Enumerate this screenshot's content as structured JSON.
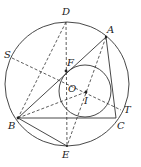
{
  "diagram": {
    "type": "geometry",
    "stroke_color": "#333333",
    "background": "#ffffff",
    "circumcircle": {
      "cx": 67,
      "cy": 84,
      "r": 62
    },
    "incircle": {
      "cx": 85,
      "cy": 91,
      "r": 26
    },
    "points": {
      "A": {
        "label": "A",
        "x": 106,
        "y": 37
      },
      "B": {
        "label": "B",
        "x": 18,
        "y": 118
      },
      "C": {
        "label": "C",
        "x": 116,
        "y": 118
      },
      "D": {
        "label": "D",
        "x": 66,
        "y": 22
      },
      "E": {
        "label": "E",
        "x": 67,
        "y": 146
      },
      "F": {
        "label": "F",
        "x": 66,
        "y": 71
      },
      "O": {
        "label": "O",
        "x": 66,
        "y": 84
      },
      "I": {
        "label": "I",
        "x": 86,
        "y": 92
      },
      "S": {
        "label": "S",
        "x": 12,
        "y": 58
      },
      "T": {
        "label": "T",
        "x": 121,
        "y": 110
      }
    },
    "solid_segments": [
      "AB",
      "BC",
      "CA",
      "BE"
    ],
    "dashed_segments": [
      "DE",
      "DB",
      "ST",
      "AE",
      "BI"
    ]
  }
}
